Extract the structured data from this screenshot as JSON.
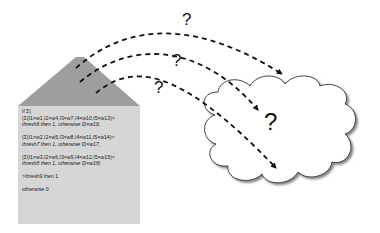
{
  "diagram": {
    "colors": {
      "roof": "#9e9e9e",
      "wall": "#d6d6d6",
      "cloud_fill": "#ffffff",
      "cloud_stroke": "#444444",
      "arrow": "#111111",
      "background": "#ffffff"
    },
    "house": {
      "lines": [
        {
          "text": "if Σ("
        },
        {
          "text": "(Σ(I1×w1,I2×w4,I3×w7,I4×w10,I5×w13)>"
        },
        {
          "text": "thresh6 then 1, otherwise 0)×w16,"
        },
        {
          "text": "(Σ(I1×w2,I2×w5,I3×w8,I4×w11,I5×w14)>"
        },
        {
          "text": "thresh7 then 1, otherwise 0)×w17,"
        },
        {
          "text": "(Σ(I1×w3,I2×w6,I3×w9,I4×w12,I5×w15)>"
        },
        {
          "text": "thresh8 then 1, otherwise 0)×w18)"
        },
        {
          "text": ">thresh9 then 1"
        },
        {
          "text": "otherwise 0"
        }
      ]
    },
    "arrows": [
      {
        "label": "?"
      },
      {
        "label": "?"
      },
      {
        "label": "?"
      }
    ],
    "cloud": {
      "label": "?"
    }
  }
}
